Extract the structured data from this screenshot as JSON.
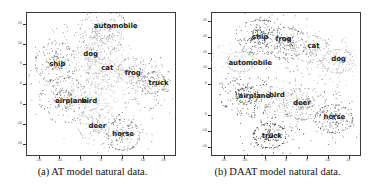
{
  "figure": {
    "panels": [
      {
        "id": "panel-a",
        "caption": "(a) AT model natural data.",
        "axes": {
          "xticks": [
            "-15",
            "-10",
            "-5",
            "0",
            "5",
            "10",
            "15"
          ],
          "yticks": [
            "15",
            "10",
            "5",
            "0",
            "-5",
            "-10",
            "-15"
          ],
          "xlim": [
            -18,
            18
          ],
          "ylim": [
            -18,
            18
          ]
        },
        "chart_data": {
          "type": "scatter",
          "title": "(a) AT model natural data.",
          "xlabel": "",
          "ylabel": "",
          "xlim": [
            -18,
            18
          ],
          "ylim": [
            -18,
            18
          ],
          "grid": false,
          "legend": "none",
          "note": "t-SNE embedding of CIFAR-10 features, 10 class clusters, grayscale points",
          "series": [
            {
              "name": "automobile",
              "label_x": 3.5,
              "label_y": 14.5,
              "center_x": 0.5,
              "center_y": 13.5,
              "spread_x": 3.6,
              "spread_y": 2.6,
              "n": 210,
              "gray": "#8d8d8d",
              "angle": 20
            },
            {
              "name": "ship",
              "label_x": -10.5,
              "label_y": 5.0,
              "center_x": -11.0,
              "center_y": 5.5,
              "spread_x": 2.8,
              "spread_y": 3.4,
              "n": 215,
              "gray": "#6e6e6e",
              "angle": -25
            },
            {
              "name": "dog",
              "label_x": -2.5,
              "label_y": 7.6,
              "center_x": -2.0,
              "center_y": 7.0,
              "spread_x": 2.7,
              "spread_y": 3.0,
              "n": 190,
              "gray": "#b4b4b4",
              "angle": 15
            },
            {
              "name": "cat",
              "label_x": 1.5,
              "label_y": 3.9,
              "center_x": 0.6,
              "center_y": 2.6,
              "spread_x": 3.0,
              "spread_y": 3.4,
              "n": 230,
              "gray": "#c0c0c0",
              "angle": -10
            },
            {
              "name": "frog",
              "label_x": 7.6,
              "label_y": 2.7,
              "center_x": 7.2,
              "center_y": 3.4,
              "spread_x": 2.3,
              "spread_y": 2.8,
              "n": 165,
              "gray": "#9a9a9a",
              "angle": 35
            },
            {
              "name": "truck",
              "label_x": 13.8,
              "label_y": 0.3,
              "center_x": 12.6,
              "center_y": 0.4,
              "spread_x": 2.7,
              "spread_y": 2.6,
              "n": 195,
              "gray": "#7c7c7c",
              "angle": 10
            },
            {
              "name": "airplane",
              "label_x": -7.2,
              "label_y": -4.2,
              "center_x": -9.0,
              "center_y": -3.8,
              "spread_x": 3.2,
              "spread_y": 2.9,
              "n": 215,
              "gray": "#717171",
              "angle": -15
            },
            {
              "name": "bird",
              "label_x": -2.8,
              "label_y": -4.3,
              "center_x": -2.0,
              "center_y": -3.4,
              "spread_x": 3.0,
              "spread_y": 3.4,
              "n": 200,
              "gray": "#c6c6c6",
              "angle": 5
            },
            {
              "name": "deer",
              "label_x": -0.9,
              "label_y": -10.4,
              "center_x": -0.9,
              "center_y": -10.6,
              "spread_x": 2.7,
              "spread_y": 2.9,
              "n": 185,
              "gray": "#b8b8b8",
              "angle": -30
            },
            {
              "name": "horse",
              "label_x": 5.3,
              "label_y": -12.5,
              "center_x": 5.2,
              "center_y": -12.6,
              "spread_x": 2.8,
              "spread_y": 3.1,
              "n": 200,
              "gray": "#737373",
              "angle": 25
            }
          ]
        }
      },
      {
        "id": "panel-b",
        "caption": "(b) DAAT model natural data.",
        "axes": {
          "xticks": [
            "-15",
            "-10",
            "-5",
            "0",
            "5",
            "10",
            "15"
          ],
          "yticks": [
            "25",
            "20",
            "15",
            "10",
            "5",
            "-5",
            "-10",
            "-15"
          ],
          "xlim": [
            -18,
            18
          ],
          "ylim": [
            -18,
            28
          ]
        },
        "chart_data": {
          "type": "scatter",
          "title": "(b) DAAT model natural data.",
          "xlabel": "",
          "ylabel": "",
          "xlim": [
            -18,
            18
          ],
          "ylim": [
            -18,
            28
          ],
          "grid": false,
          "legend": "none",
          "note": "t-SNE embedding of CIFAR-10 features, 10 class clusters, more dispersed than panel (a)",
          "series": [
            {
              "name": "ship",
              "label_x": -6.2,
              "label_y": 20.0,
              "center_x": -6.4,
              "center_y": 20.2,
              "spread_x": 2.6,
              "spread_y": 3.2,
              "n": 215,
              "gray": "#4a4a4a",
              "angle": -20
            },
            {
              "name": "frog",
              "label_x": -0.6,
              "label_y": 19.4,
              "center_x": -0.2,
              "center_y": 18.2,
              "spread_x": 2.6,
              "spread_y": 3.6,
              "n": 210,
              "gray": "#5c5c5c",
              "angle": 10
            },
            {
              "name": "cat",
              "label_x": 6.6,
              "label_y": 17.0,
              "center_x": 6.0,
              "center_y": 16.2,
              "spread_x": 3.0,
              "spread_y": 3.2,
              "n": 200,
              "gray": "#a8a8a8",
              "angle": 25
            },
            {
              "name": "dog",
              "label_x": 12.6,
              "label_y": 13.0,
              "center_x": 12.4,
              "center_y": 12.4,
              "spread_x": 3.0,
              "spread_y": 3.0,
              "n": 195,
              "gray": "#b0b0b0",
              "angle": -12
            },
            {
              "name": "automobile",
              "label_x": -8.6,
              "label_y": 11.6,
              "center_x": -11.0,
              "center_y": 12.2,
              "spread_x": 3.4,
              "spread_y": 3.2,
              "n": 220,
              "gray": "#c2c2c2",
              "angle": 18
            },
            {
              "name": "airplane",
              "label_x": -7.6,
              "label_y": 1.2,
              "center_x": -9.4,
              "center_y": 1.4,
              "spread_x": 3.4,
              "spread_y": 3.0,
              "n": 225,
              "gray": "#3f3f3f",
              "angle": -28
            },
            {
              "name": "bird",
              "label_x": -2.2,
              "label_y": 1.6,
              "center_x": -1.6,
              "center_y": 0.4,
              "spread_x": 3.0,
              "spread_y": 3.4,
              "n": 200,
              "gray": "#c8c8c8",
              "angle": 8
            },
            {
              "name": "deer",
              "label_x": 3.8,
              "label_y": -1.0,
              "center_x": 4.4,
              "center_y": -1.2,
              "spread_x": 3.0,
              "spread_y": 3.2,
              "n": 195,
              "gray": "#8a8a8a",
              "angle": -18
            },
            {
              "name": "horse",
              "label_x": 11.6,
              "label_y": -5.4,
              "center_x": 11.4,
              "center_y": -6.0,
              "spread_x": 3.0,
              "spread_y": 3.4,
              "n": 210,
              "gray": "#5a5a5a",
              "angle": 22
            },
            {
              "name": "truck",
              "label_x": -3.4,
              "label_y": -11.6,
              "center_x": -4.0,
              "center_y": -11.4,
              "spread_x": 2.8,
              "spread_y": 3.4,
              "n": 215,
              "gray": "#333333",
              "angle": -8
            }
          ]
        }
      }
    ]
  }
}
